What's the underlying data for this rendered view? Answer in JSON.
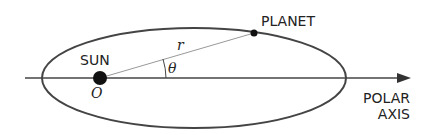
{
  "labels": {
    "sun": "SUN",
    "origin": "O",
    "radius": "r",
    "angle": "θ",
    "planet": "PLANET",
    "polar_line1": "POLAR",
    "polar_line2": "AXIS"
  },
  "colors": {
    "ink": "#333333",
    "ray": "#888888",
    "background": "#ffffff"
  }
}
